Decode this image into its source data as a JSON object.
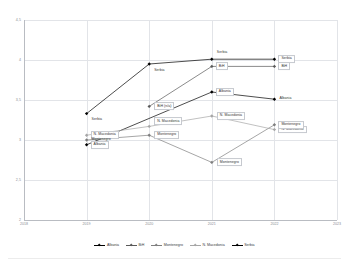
{
  "chart_data": {
    "type": "line",
    "title": "",
    "xlabel": "",
    "ylabel": "",
    "x": [
      2018,
      2019,
      2020,
      2021,
      2022,
      2023
    ],
    "xlim": [
      2018,
      2023
    ],
    "ylim": [
      2,
      4.5
    ],
    "yticks": [
      "2",
      "2,5",
      "3",
      "3,5",
      "4",
      "4,5"
    ],
    "ytick_values": [
      2,
      2.5,
      3,
      3.5,
      4,
      4.5
    ],
    "xticks": [
      "2018",
      "2019",
      "2020",
      "2021",
      "2022",
      "2023"
    ],
    "grid": true,
    "legend_position": "bottom",
    "series": [
      {
        "name": "Albania",
        "color": "#000000",
        "x": [
          2019,
          2021,
          2022
        ],
        "values": [
          2.94,
          3.6,
          3.51
        ]
      },
      {
        "name": "BiH",
        "color": "#595959",
        "x": [
          2020,
          2021,
          2022
        ],
        "values": [
          3.42,
          3.92,
          3.92
        ]
      },
      {
        "name": "Montenegro",
        "color": "#7f7f7f",
        "x": [
          2019,
          2020,
          2021,
          2022
        ],
        "values": [
          3.0,
          3.06,
          2.72,
          3.19
        ]
      },
      {
        "name": "N. Macedonia",
        "color": "#a6a6a6",
        "x": [
          2019,
          2020,
          2021,
          2022
        ],
        "values": [
          3.06,
          3.17,
          3.3,
          3.13
        ]
      },
      {
        "name": "Serbia",
        "color": "#000000",
        "x": [
          2019,
          2020,
          2021,
          2022
        ],
        "values": [
          3.33,
          3.95,
          4.01,
          4.01
        ]
      }
    ],
    "point_labels": [
      {
        "text": "Serbia",
        "x": 2019,
        "y": 3.33,
        "dx": 4,
        "dy": 6,
        "frame": false
      },
      {
        "text": "Serbia",
        "x": 2020,
        "y": 3.95,
        "dx": 4,
        "dy": 7,
        "frame": false
      },
      {
        "text": "Serbia",
        "x": 2021,
        "y": 4.01,
        "dx": 4,
        "dy": -6,
        "frame": false
      },
      {
        "text": "Serbia",
        "x": 2022,
        "y": 4.01,
        "dx": 4,
        "dy": 0,
        "frame": true
      },
      {
        "text": "BiH (n/a)",
        "x": 2020,
        "y": 3.42,
        "dx": 5,
        "dy": 0,
        "frame": true
      },
      {
        "text": "BiH",
        "x": 2021,
        "y": 3.92,
        "dx": 4,
        "dy": 0,
        "frame": true
      },
      {
        "text": "BiH",
        "x": 2022,
        "y": 3.92,
        "dx": 4,
        "dy": 0,
        "frame": true
      },
      {
        "text": "Albania",
        "x": 2019,
        "y": 2.94,
        "dx": 4,
        "dy": 0,
        "frame": true
      },
      {
        "text": "Albania",
        "x": 2021,
        "y": 3.6,
        "dx": 4,
        "dy": 0,
        "frame": true
      },
      {
        "text": "Albania",
        "x": 2022,
        "y": 3.51,
        "dx": 4,
        "dy": 0,
        "frame": false
      },
      {
        "text": "N. Macedonia",
        "x": 2019,
        "y": 3.06,
        "dx": 4,
        "dy": 0,
        "frame": true
      },
      {
        "text": "N. Macedonia",
        "x": 2020,
        "y": 3.17,
        "dx": 5,
        "dy": -5,
        "frame": true
      },
      {
        "text": "N. Macedonia",
        "x": 2021,
        "y": 3.3,
        "dx": 5,
        "dy": 0,
        "frame": true
      },
      {
        "text": "N. Macedonia",
        "x": 2022,
        "y": 3.13,
        "dx": 4,
        "dy": 0,
        "frame": true
      },
      {
        "text": "Montenegro",
        "x": 2019,
        "y": 3.0,
        "dx": 4,
        "dy": 0,
        "frame": false
      },
      {
        "text": "Montenegro",
        "x": 2020,
        "y": 3.06,
        "dx": 5,
        "dy": 0,
        "frame": true
      },
      {
        "text": "Montenegro",
        "x": 2021,
        "y": 2.72,
        "dx": 5,
        "dy": 0,
        "frame": true
      },
      {
        "text": "Montenegro",
        "x": 2022,
        "y": 3.19,
        "dx": 4,
        "dy": 0,
        "frame": true
      }
    ]
  },
  "legend": {
    "items": [
      {
        "label": "Albania"
      },
      {
        "label": "BiH"
      },
      {
        "label": "Montenegro"
      },
      {
        "label": "N. Macedonia"
      },
      {
        "label": "Serbia"
      }
    ]
  }
}
